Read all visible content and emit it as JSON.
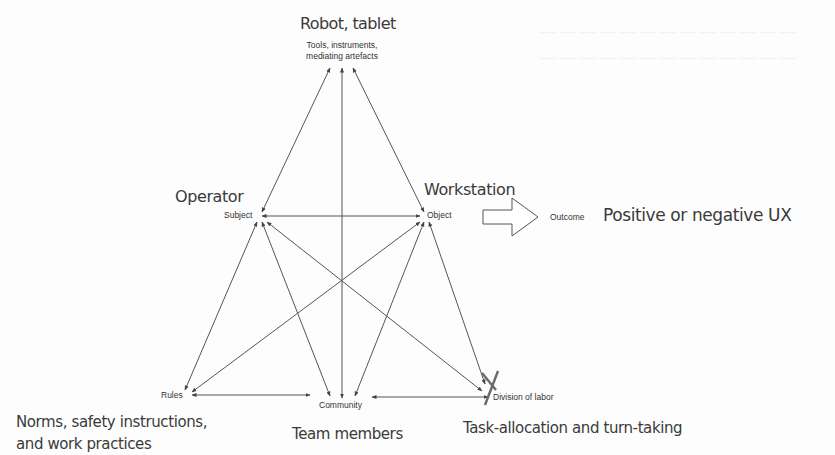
{
  "diagram": {
    "type": "activity-theory-triangle",
    "top": {
      "caption": "Robot, tablet",
      "node": "Tools, instruments,",
      "node_line2": "mediating artefacts"
    },
    "subject": {
      "caption": "Operator",
      "node": "Subject"
    },
    "object": {
      "caption": "Workstation",
      "node": "Object"
    },
    "outcome": {
      "node": "Outcome",
      "caption": "Positive or negative UX"
    },
    "rules": {
      "node": "Rules",
      "caption_line1": "Norms, safety instructions,",
      "caption_line2": "and work practices"
    },
    "community": {
      "node": "Community",
      "caption": "Team members"
    },
    "division": {
      "node": "Division of labor",
      "caption": "Task-allocation and turn-taking",
      "mark": "X"
    },
    "colors": {
      "line": "#444444",
      "text": "#333333",
      "mark": "#666666"
    }
  }
}
